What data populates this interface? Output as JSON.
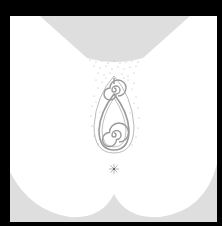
{
  "artwork": {
    "description": "Abstract monochrome illustration: gray trapezoid at top, stippled dots, double spiral teardrop figure, small starburst, and gray scalloped shape at bottom on white within a black border",
    "colors": {
      "border": "#000000",
      "background": "#ffffff",
      "gray_fill": "#dcdcdc",
      "line": "#9a9a9a",
      "stipple": "#b4b4b4"
    }
  }
}
